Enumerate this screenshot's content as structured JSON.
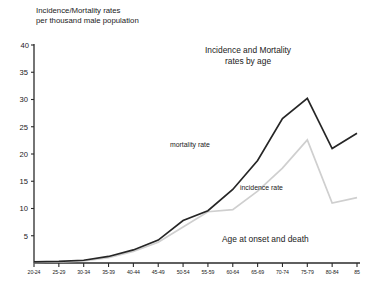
{
  "chart_data": {
    "type": "line",
    "title": "Incidence and Mortality rates by age",
    "title_line1": "Incidence and Mortality",
    "title_line2": "rates by age",
    "header_line1": "Incidence/Mortality rates",
    "header_line2": "per thousand male population",
    "ylabel": "Incidence/Mortality rates per thousand male population",
    "xlabel": "Age at onset and death",
    "categories": [
      "20-24",
      "25-29",
      "30-34",
      "35-39",
      "40-44",
      "45-49",
      "50-54",
      "55-59",
      "60-64",
      "65-69",
      "70-74",
      "75-79",
      "80-84",
      "85"
    ],
    "yticks": [
      5,
      10,
      15,
      20,
      25,
      30,
      35,
      40
    ],
    "ylim": [
      0,
      40
    ],
    "grid": false,
    "legend": "inline-annotations",
    "series": [
      {
        "name": "mortality rate",
        "color": "#262626",
        "annotation": "mortality rate",
        "values": [
          0.2,
          0.3,
          0.5,
          1.2,
          2.4,
          4.2,
          7.8,
          9.6,
          13.5,
          18.8,
          26.5,
          30.2,
          30.0,
          37.2
        ]
      },
      {
        "name": "incidence rate",
        "color": "#cfcfcf",
        "annotation": "incidence rate",
        "values": [
          0.1,
          0.2,
          0.4,
          1.0,
          2.1,
          3.8,
          6.6,
          9.4,
          9.8,
          13.2,
          17.4,
          22.6,
          23.4,
          23.0
        ]
      }
    ],
    "tail": {
      "mortality": [
        21.0,
        23.8
      ],
      "incidence": [
        11.0,
        12.0
      ]
    }
  }
}
